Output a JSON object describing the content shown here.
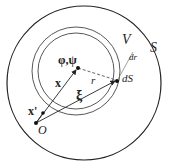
{
  "labels": {
    "S": "S",
    "V": "V",
    "dr": "dr",
    "dS": "dS",
    "r": "r",
    "xi": "ξ",
    "x": "x",
    "phipsi": "φ,ψ",
    "xprime": "x'",
    "O": "O"
  },
  "colors": {
    "stroke": "#222222",
    "dashed": "#555555",
    "inner": "#444444"
  }
}
